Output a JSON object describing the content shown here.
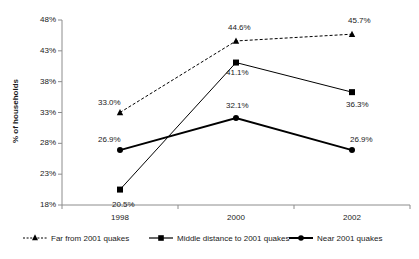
{
  "chart_data": {
    "type": "line",
    "title": "",
    "subtitle": "",
    "xlabel": "",
    "ylabel": "% of households",
    "categories": [
      "1998",
      "2000",
      "2002"
    ],
    "ylim": [
      18,
      48
    ],
    "yticks": [
      "18%",
      "23%",
      "28%",
      "33%",
      "38%",
      "43%",
      "48%"
    ],
    "ytick_values": [
      18,
      23,
      28,
      33,
      38,
      43,
      48
    ],
    "grid": false,
    "legend_position": "bottom",
    "series": [
      {
        "name": "Far from 2001 quakes",
        "marker": "triangle",
        "line_style": "dashed",
        "line_width": 1,
        "color": "#000000",
        "values": [
          33.0,
          44.6,
          45.7
        ],
        "labels": [
          "33.0%",
          "44.6%",
          "45.7%"
        ]
      },
      {
        "name": "Middle distance to 2001 quakes",
        "marker": "square",
        "line_style": "solid",
        "line_width": 1,
        "color": "#000000",
        "values": [
          20.5,
          41.1,
          36.3
        ],
        "labels": [
          "20.5%",
          "41.1%",
          "36.3%"
        ]
      },
      {
        "name": "Near 2001 quakes",
        "marker": "circle",
        "line_style": "solid",
        "line_width": 2,
        "color": "#000000",
        "values": [
          26.9,
          32.1,
          26.9
        ],
        "labels": [
          "26.9%",
          "32.1%",
          "26.9%"
        ]
      }
    ],
    "axis_color": "#8c8c8c"
  }
}
